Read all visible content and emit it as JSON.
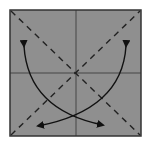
{
  "diagram": {
    "type": "origami-fold-diagram",
    "paper": {
      "fill": "#8f8f8f",
      "stroke": "#333333",
      "x": 10,
      "y": 10,
      "width": 131,
      "height": 126
    },
    "crease_lines": [
      {
        "name": "vertical-crease",
        "style": "solid"
      },
      {
        "name": "horizontal-crease",
        "style": "solid"
      }
    ],
    "fold_lines": [
      {
        "name": "diagonal-valley-fold-1",
        "style": "dashed",
        "direction": "top-left to bottom-right"
      },
      {
        "name": "diagonal-valley-fold-2",
        "style": "dashed",
        "direction": "bottom-left to top-right"
      }
    ],
    "arrows": [
      {
        "name": "fold-arrow-left",
        "from": "upper-left",
        "to": "lower-right",
        "bidirectional": true
      },
      {
        "name": "fold-arrow-right",
        "from": "upper-right",
        "to": "lower-left",
        "bidirectional": true
      }
    ]
  }
}
